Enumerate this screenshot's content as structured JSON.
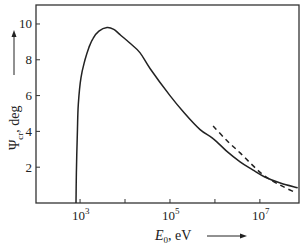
{
  "chart_data": {
    "type": "line",
    "title": "",
    "xlabel": "E",
    "xlabel_subscript": "0",
    "xlabel_unit": ", eV",
    "ylabel": "Ψ",
    "ylabel_subscript": "cr",
    "ylabel_unit": ", deg",
    "xscale": "log",
    "xlim_log10": [
      2.02,
      7.87
    ],
    "ylim": [
      0,
      11.06
    ],
    "grid": false,
    "legend": "none",
    "x_ticks_log10": [
      3,
      4,
      5,
      6,
      7
    ],
    "x_tick_labels": [
      {
        "log10": 3,
        "base": "10",
        "exp": "3"
      },
      {
        "log10": 5,
        "base": "10",
        "exp": "5"
      },
      {
        "log10": 7,
        "base": "10",
        "exp": "7"
      }
    ],
    "y_ticks": [
      2,
      4,
      6,
      8,
      10
    ],
    "y_tick_labels": [
      "2",
      "4",
      "6",
      "8",
      "10"
    ],
    "axis_arrows": {
      "x": "right",
      "y": "up"
    },
    "series": [
      {
        "name": "calculated",
        "style": "solid",
        "color": "#222222",
        "points_log10E_psi": [
          [
            2.91,
            0
          ],
          [
            2.92,
            2.0
          ],
          [
            2.94,
            4.0
          ],
          [
            2.96,
            5.5
          ],
          [
            3.02,
            7.0
          ],
          [
            3.11,
            8.0
          ],
          [
            3.2,
            8.7
          ],
          [
            3.29,
            9.2
          ],
          [
            3.42,
            9.6
          ],
          [
            3.6,
            9.8
          ],
          [
            3.75,
            9.7
          ],
          [
            3.89,
            9.4
          ],
          [
            4.1,
            8.95
          ],
          [
            4.33,
            8.4
          ],
          [
            4.56,
            7.5
          ],
          [
            5.0,
            6.0
          ],
          [
            5.33,
            5.0
          ],
          [
            5.67,
            4.1
          ],
          [
            5.96,
            3.6
          ],
          [
            6.26,
            2.9
          ],
          [
            6.56,
            2.3
          ],
          [
            6.84,
            1.85
          ],
          [
            7.11,
            1.45
          ],
          [
            7.47,
            1.1
          ],
          [
            7.84,
            0.85
          ]
        ]
      },
      {
        "name": "asymptotic",
        "style": "dashed",
        "color": "#222222",
        "points_log10E_psi": [
          [
            5.96,
            4.3
          ],
          [
            6.26,
            3.5
          ],
          [
            6.56,
            2.8
          ],
          [
            6.84,
            2.1
          ],
          [
            7.11,
            1.5
          ],
          [
            7.45,
            1.0
          ],
          [
            7.78,
            0.6
          ]
        ]
      }
    ]
  }
}
